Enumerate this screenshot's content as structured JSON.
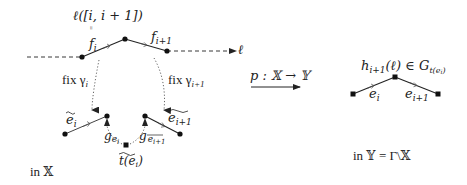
{
  "left_panel": {
    "interval_label": "ℓ([i, i + 1])",
    "equals_sign": "=",
    "edge_f_i": "f",
    "edge_f_i_sub": "i",
    "edge_f_i1": "f",
    "edge_f_i1_sub": "i+1",
    "line_label": "ℓ",
    "fix_gamma_i": "fix γ",
    "fix_gamma_i_sub": "i",
    "fix_gamma_i1": "fix γ",
    "fix_gamma_i1_sub": "i+1",
    "lift_e_i": "e",
    "lift_e_i_sub": "i",
    "lift_e_i1": "e",
    "lift_e_i1_sub": "i+1",
    "g_e_i": "g",
    "g_e_i_sub": "e",
    "g_e_i_subsub": "i",
    "g_e_i1": "g",
    "g_e_i1_sub": "e",
    "g_e_i1_subsub": "i+1",
    "vertex_label": "t(e",
    "vertex_label_sub": "i",
    "vertex_label_close": ")",
    "space_label": "in 𝕏"
  },
  "projection": {
    "label": "p : 𝕏 → 𝕐"
  },
  "right_panel": {
    "vertex_group_label": "h",
    "vertex_group_sub": "i+1",
    "vertex_group_rest": "(ℓ) ∈ G",
    "vertex_group_sub2": "t(e",
    "vertex_group_sub2_i": "i",
    "vertex_group_sub2_close": ")",
    "edge_e_i": "e",
    "edge_e_i_sub": "i",
    "edge_e_i1": "e",
    "edge_e_i1_sub": "i+1",
    "space_label": "in 𝕐 = Γ\\𝕏"
  },
  "colors": {
    "ink": "#222222",
    "dotted": "#666666",
    "background": "#ffffff"
  }
}
